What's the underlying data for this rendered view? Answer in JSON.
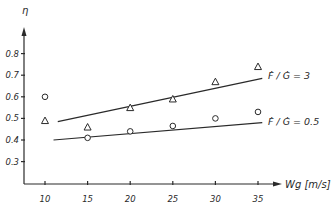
{
  "chart_data": {
    "type": "scatter",
    "title": "",
    "xlabel": "Wg [m/s]",
    "ylabel": "η",
    "xlim": [
      7,
      39
    ],
    "ylim": [
      0.2,
      0.88
    ],
    "x_ticks": [
      10,
      15,
      20,
      25,
      30,
      35
    ],
    "y_ticks": [
      0.3,
      0.4,
      0.5,
      0.6,
      0.7,
      0.8
    ],
    "x_tick_labels": [
      "10",
      "15",
      "20",
      "25",
      "30",
      "35"
    ],
    "y_tick_labels": [
      "0.3",
      "0.4",
      "0.5",
      "0.6",
      "0.7",
      "0.8"
    ],
    "grid": false,
    "legend_position": "inline-right",
    "x": [
      10,
      15,
      20,
      25,
      30,
      35
    ],
    "series": [
      {
        "name": "F/G = 3",
        "label_text": "Ḟ / Ġ  = 3",
        "marker": "triangle",
        "values": [
          0.49,
          0.46,
          0.55,
          0.59,
          0.67,
          0.74
        ],
        "fit_line": {
          "x": [
            11.5,
            35.5
          ],
          "y": [
            0.485,
            0.685
          ]
        }
      },
      {
        "name": "F/G = 0.5",
        "label_text": "Ḟ / Ġ  = 0.5",
        "marker": "circle",
        "values": [
          0.6,
          0.41,
          0.44,
          0.465,
          0.5,
          0.53
        ],
        "fit_line": {
          "x": [
            11.0,
            35.5
          ],
          "y": [
            0.4,
            0.48
          ]
        }
      }
    ]
  },
  "axes": {
    "x_label": "Wg [m/s]",
    "y_label": "η"
  }
}
